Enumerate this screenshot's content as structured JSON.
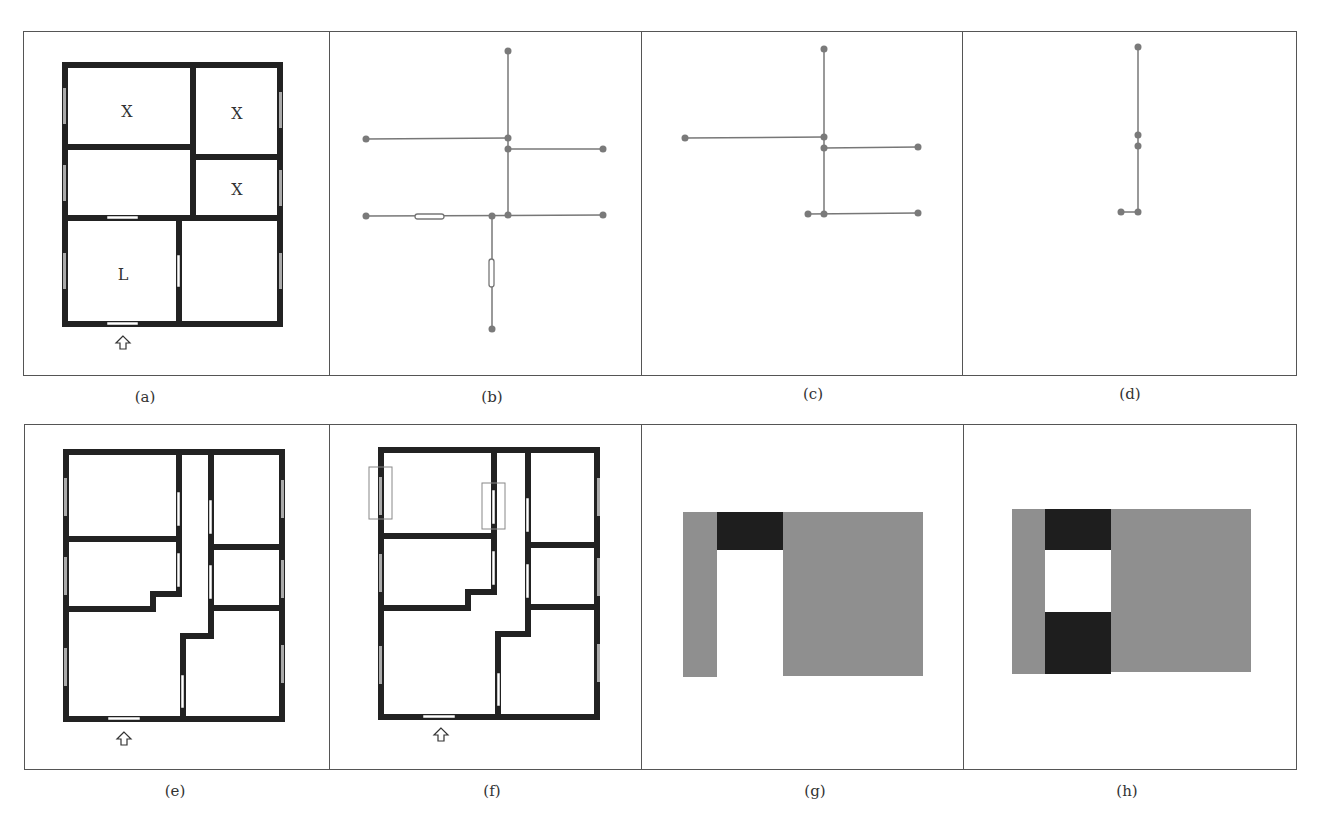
{
  "figure": {
    "captions": [
      "(a)",
      "(b)",
      "(c)",
      "(d)",
      "(e)",
      "(f)",
      "(g)",
      "(h)"
    ],
    "colors": {
      "wall": "#222222",
      "window": "#aaaaaa",
      "door": "#ffffff",
      "graph_line": "#777777",
      "graph_node": "#7a7a7a",
      "grid_gray": "#8f8f8f",
      "grid_dark": "#1e1e1e",
      "frame": "#555555"
    },
    "panel_a": {
      "room_labels": [
        {
          "text": "X",
          "room": "top-left"
        },
        {
          "text": "X",
          "room": "top-right"
        },
        {
          "text": "X",
          "room": "middle-right"
        },
        {
          "text": "L",
          "room": "bottom-left"
        }
      ],
      "entrance_icon": "up-arrow-outline"
    },
    "panel_b": {
      "nodes": 12,
      "door_markers": 2
    },
    "panel_c": {
      "nodes": 8
    },
    "panel_d": {
      "nodes": 5
    },
    "panel_e": {
      "entrance_icon": "up-arrow-outline"
    },
    "panel_f": {
      "entrance_icon": "up-arrow-outline",
      "highlight_boxes": 2
    },
    "panel_g": {
      "grid_cells": "3 columns: gray | dark-top / white | gray"
    },
    "panel_h": {
      "grid_cells": "3 columns: gray | dark-top / white / dark-bottom | gray"
    }
  }
}
